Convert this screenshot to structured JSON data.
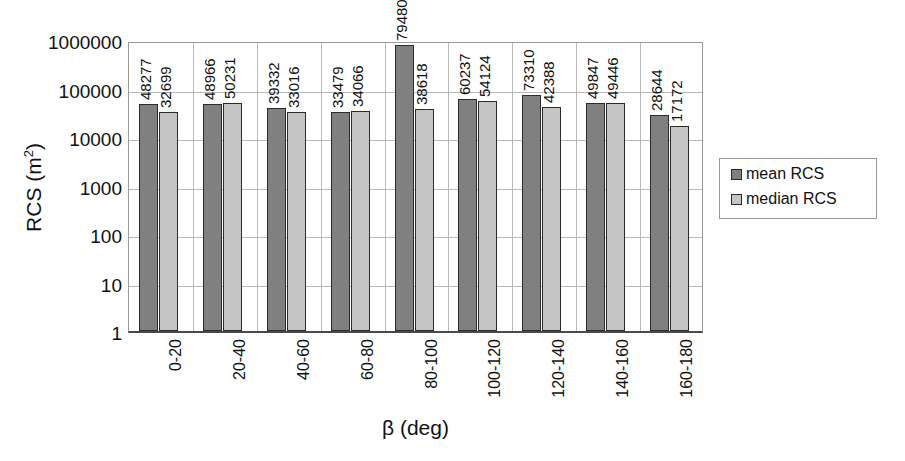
{
  "chart_data": {
    "type": "bar",
    "title": "",
    "xlabel": "β (deg)",
    "ylabel": "RCS (m²)",
    "ylabel_base": "RCS (m",
    "ylabel_sup": "2",
    "ylabel_tail": ")",
    "yscale": "log",
    "ylim": [
      1,
      1000000
    ],
    "ytick_labels": [
      "1000000",
      "100000",
      "10000",
      "1000",
      "100",
      "10",
      "1"
    ],
    "ytick_values": [
      1000000,
      100000,
      10000,
      1000,
      100,
      10,
      1
    ],
    "grid": true,
    "legend_position": "right",
    "categories": [
      "0-20",
      "20-40",
      "40-60",
      "60-80",
      "80-100",
      "100-120",
      "120-140",
      "140-160",
      "160-180"
    ],
    "series": [
      {
        "name": "mean RCS",
        "color": "#808080",
        "values": [
          48277,
          48966,
          39332,
          33479,
          794808,
          60237,
          73310,
          49847,
          28644
        ],
        "labels": [
          "48277",
          "48966",
          "39332",
          "33479",
          "794808",
          "60237",
          "73310",
          "49847",
          "28644"
        ]
      },
      {
        "name": "median RCS",
        "color": "#c5c5c5",
        "values": [
          32699,
          50231,
          33016,
          34066,
          38618,
          54124,
          42388,
          49446,
          17172
        ],
        "labels": [
          "32699",
          "50231",
          "33016",
          "34066",
          "38618",
          "54124",
          "42388",
          "49446",
          "17172"
        ]
      }
    ]
  },
  "legend": {
    "items": [
      {
        "label": "mean RCS",
        "color": "#808080"
      },
      {
        "label": "median RCS",
        "color": "#c5c5c5"
      }
    ]
  }
}
